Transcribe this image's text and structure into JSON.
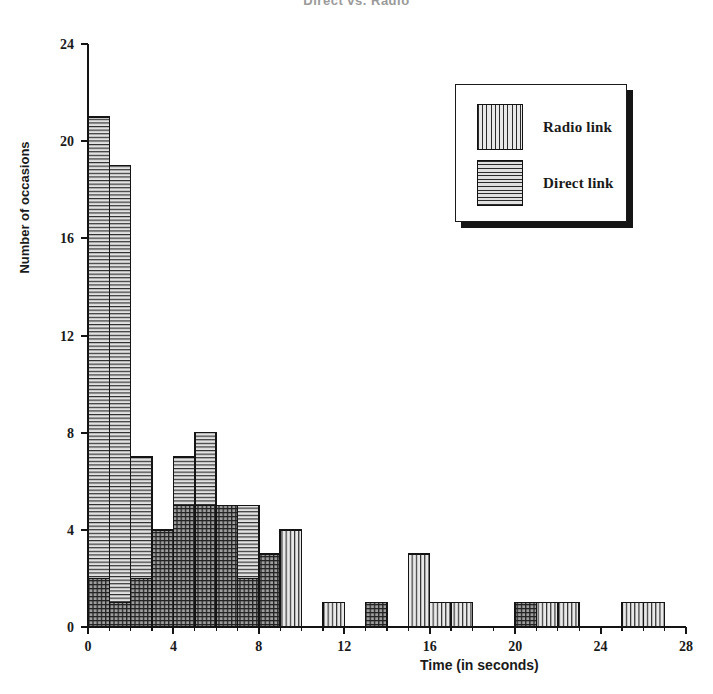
{
  "figure": {
    "title": "Direct vs. Radio",
    "width": 713,
    "height": 694
  },
  "axes": {
    "ylabel": "Number of occasions",
    "xlabel": "Time (in seconds)",
    "y_ticks": [
      "0",
      "4",
      "8",
      "12",
      "16",
      "20",
      "24"
    ],
    "x_ticks": [
      "0",
      "4",
      "8",
      "12",
      "16",
      "20",
      "24",
      "28"
    ]
  },
  "legend": {
    "items": [
      {
        "label": "Radio link",
        "swatch": "vertical-hatch"
      },
      {
        "label": "Direct link",
        "swatch": "horizontal-hatch"
      }
    ]
  },
  "colors": {
    "ink": "#1a1a1a",
    "radio_fill": "#e8e8e8",
    "direct_fill": "#dedede",
    "overlap_fill": "#6e6e6e",
    "background": "#ffffff"
  },
  "chart_data": {
    "type": "bar",
    "title": "Direct vs. Radio",
    "xlabel": "Time (in seconds)",
    "ylabel": "Number of occasions",
    "xlim": [
      0,
      28
    ],
    "ylim": [
      0,
      24
    ],
    "grid": false,
    "legend_position": "upper-right",
    "bin_width": 1,
    "bin_starts": [
      0,
      1,
      2,
      3,
      4,
      5,
      6,
      7,
      8,
      9,
      10,
      11,
      12,
      13,
      14,
      15,
      16,
      17,
      18,
      19,
      20,
      21,
      22,
      23,
      24,
      25,
      26,
      27
    ],
    "categories": [
      "0-1",
      "1-2",
      "2-3",
      "3-4",
      "4-5",
      "5-6",
      "6-7",
      "7-8",
      "8-9",
      "9-10",
      "10-11",
      "11-12",
      "12-13",
      "13-14",
      "14-15",
      "15-16",
      "16-17",
      "17-18",
      "18-19",
      "19-20",
      "20-21",
      "21-22",
      "22-23",
      "23-24",
      "24-25",
      "25-26",
      "26-27",
      "27-28"
    ],
    "series": [
      {
        "name": "Direct link",
        "hatch": "horizontal",
        "values": [
          21,
          19,
          7,
          4,
          7,
          8,
          5,
          5,
          3,
          0,
          0,
          0,
          0,
          1,
          0,
          0,
          0,
          0,
          0,
          0,
          1,
          0,
          0,
          0,
          0,
          0,
          0,
          0
        ]
      },
      {
        "name": "Radio link",
        "hatch": "vertical",
        "values": [
          2,
          1,
          2,
          4,
          5,
          5,
          5,
          2,
          3,
          4,
          0,
          1,
          0,
          1,
          0,
          3,
          1,
          1,
          0,
          0,
          1,
          1,
          1,
          0,
          0,
          1,
          1,
          0
        ]
      }
    ]
  }
}
